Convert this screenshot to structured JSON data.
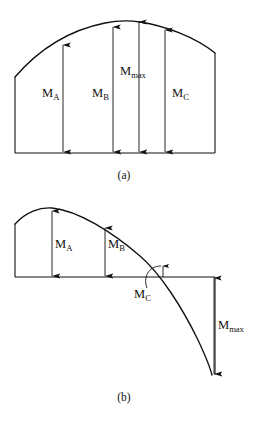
{
  "figure": {
    "background_color": "#ffffff",
    "line_color": "#111111",
    "panels": [
      {
        "id": "panel-a",
        "caption": "(a)",
        "description": "Bending moment diagram entirely above the baseline with maximum within the span",
        "baseline_y": 153,
        "left_edge_x": 15,
        "right_edge_x": 215,
        "left_edge_top_y": 77,
        "right_edge_top_y": 53,
        "peak_x": 130,
        "peak_y": 21,
        "ordinates": [
          {
            "label": "M",
            "subscript": "A",
            "x": 63,
            "top_y": 44,
            "label_x": 46,
            "label_y": 95
          },
          {
            "label": "M",
            "subscript": "B",
            "x": 113,
            "top_y": 26,
            "label_x": 96,
            "label_y": 95
          },
          {
            "label": "M",
            "subscript": "max",
            "x": 139,
            "top_y": 21,
            "label_x": 122,
            "label_y": 73
          },
          {
            "label": "M",
            "subscript": "C",
            "x": 165,
            "top_y": 29,
            "label_x": 176,
            "label_y": 95
          }
        ]
      },
      {
        "id": "panel-b",
        "caption": "(b)",
        "description": "Bending moment diagram crossing the baseline with maximum negative moment at the right support",
        "baseline_y": 277,
        "left_edge_x": 15,
        "right_edge_x": 215,
        "left_edge_top_y": 224,
        "peak_x": 52,
        "peak_y": 208,
        "zero_crossing_x": 175,
        "curve_end_x": 212,
        "curve_end_y": 375,
        "ordinates": [
          {
            "label": "M",
            "subscript": "A",
            "x": 52,
            "top_y": 210,
            "label_x": 58,
            "label_y": 245
          },
          {
            "label": "M",
            "subscript": "B",
            "x": 105,
            "top_y": 227,
            "label_x": 111,
            "label_y": 245
          },
          {
            "label": "M",
            "subscript": "C",
            "x": 163,
            "top_y": 265,
            "label_x": 138,
            "label_y": 292
          },
          {
            "label": "M",
            "subscript": "max",
            "x": 214,
            "top_y": 277,
            "label_x": 219,
            "label_y": 325
          }
        ]
      }
    ]
  }
}
